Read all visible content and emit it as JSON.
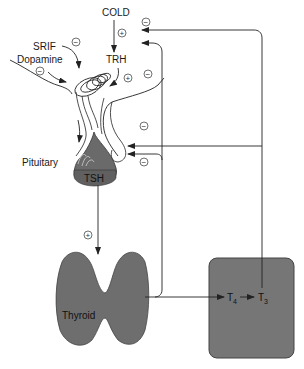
{
  "diagram": {
    "labels": {
      "cold": "COLD",
      "srif": "SRIF",
      "dopamine": "Dopamine",
      "trh": "TRH",
      "pituitary": "Pituitary",
      "tsh": "TSH",
      "thyroid": "Thyroid",
      "t4": "T",
      "t4_sub": "4",
      "t3": "T",
      "t3_sub": "3"
    },
    "signs": {
      "plus": "+",
      "minus": "−"
    },
    "colors": {
      "gland_fill": "#6e6e6e",
      "peripheral_fill": "#767676",
      "line": "#333333",
      "background": "#ffffff"
    },
    "relationships": [
      {
        "from": "COLD",
        "to": "TRH",
        "effect": "+"
      },
      {
        "from": "SRIF",
        "to": "Pituitary",
        "effect": "−"
      },
      {
        "from": "Dopamine",
        "to": "Pituitary",
        "effect": "−"
      },
      {
        "from": "TRH",
        "to": "Pituitary",
        "effect": "+"
      },
      {
        "from": "T3",
        "to": "TRH",
        "effect": "−"
      },
      {
        "from": "T4",
        "to": "TRH",
        "effect": "−"
      },
      {
        "from": "T3",
        "to": "TSH",
        "effect": "−"
      },
      {
        "from": "T4",
        "to": "TSH",
        "effect": "−"
      },
      {
        "from": "TSH",
        "to": "Thyroid",
        "effect": "+"
      },
      {
        "from": "Thyroid",
        "to": "T4",
        "effect": "secretes"
      },
      {
        "from": "T4",
        "to": "T3",
        "effect": "converts"
      }
    ]
  }
}
